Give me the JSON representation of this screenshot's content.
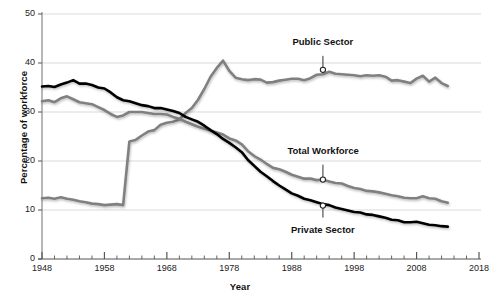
{
  "chart_data": {
    "type": "line",
    "title": "",
    "xlabel": "Year",
    "ylabel": "Percentage of workforce",
    "xlim": [
      1948,
      2018
    ],
    "ylim": [
      0,
      50
    ],
    "grid": true,
    "legend_position": "inline-annotations",
    "xticks": [
      1948,
      1958,
      1968,
      1978,
      1988,
      1998,
      2008,
      2018
    ],
    "yticks": [
      0,
      10,
      20,
      30,
      40,
      50
    ],
    "xtick_labels": [
      "1948",
      "1958",
      "1968",
      "1978",
      "1988",
      "1998",
      "2008",
      "2018"
    ],
    "ytick_labels": [
      "0",
      "10",
      "20",
      "30",
      "40",
      "50"
    ],
    "minor_tick_interval": 2,
    "colors": {
      "public_sector": "#808080",
      "total_workforce": "#808080",
      "private_sector": "#000000",
      "gridline": "#d9d9d9",
      "axis": "#999999"
    },
    "annotations": [
      {
        "label": "Public Sector",
        "x": 1993,
        "y": 38.6,
        "label_offset_y": -21
      },
      {
        "label": "Total Workforce",
        "x": 1993,
        "y": 16.2,
        "label_offset_y": -22
      },
      {
        "label": "Private Sector",
        "x": 1993,
        "y": 10.9,
        "label_offset_y": 19
      }
    ],
    "series": [
      {
        "name": "Public Sector",
        "color": "#808080",
        "x": [
          1948,
          1949,
          1950,
          1951,
          1952,
          1953,
          1954,
          1955,
          1956,
          1957,
          1958,
          1959,
          1960,
          1961,
          1962,
          1963,
          1964,
          1965,
          1966,
          1967,
          1968,
          1969,
          1970,
          1971,
          1972,
          1973,
          1974,
          1975,
          1976,
          1977,
          1978,
          1979,
          1980,
          1981,
          1982,
          1983,
          1984,
          1985,
          1986,
          1987,
          1988,
          1989,
          1990,
          1991,
          1992,
          1993,
          1994,
          1995,
          1996,
          1997,
          1998,
          1999,
          2000,
          2001,
          2002,
          2003,
          2004,
          2005,
          2006,
          2007,
          2008,
          2009,
          2010,
          2011,
          2012,
          2013
        ],
        "values": [
          12.4,
          12.5,
          12.3,
          12.6,
          12.3,
          12.1,
          11.8,
          11.6,
          11.3,
          11.2,
          11.0,
          11.1,
          11.2,
          11.0,
          24.0,
          24.3,
          25.2,
          26.0,
          26.3,
          27.4,
          27.8,
          28.0,
          28.5,
          29.8,
          30.8,
          32.5,
          34.7,
          37.2,
          39.0,
          40.5,
          38.4,
          37.0,
          36.7,
          36.5,
          36.7,
          36.6,
          36.0,
          36.1,
          36.4,
          36.6,
          36.8,
          36.8,
          36.5,
          36.9,
          37.6,
          37.7,
          38.2,
          37.8,
          37.7,
          37.6,
          37.5,
          37.3,
          37.5,
          37.4,
          37.5,
          37.2,
          36.4,
          36.5,
          36.2,
          35.9,
          36.8,
          37.4,
          36.2,
          37.0,
          35.9,
          35.3
        ]
      },
      {
        "name": "Total Workforce",
        "color": "#808080",
        "x": [
          1948,
          1949,
          1950,
          1951,
          1952,
          1953,
          1954,
          1955,
          1956,
          1957,
          1958,
          1959,
          1960,
          1961,
          1962,
          1963,
          1964,
          1965,
          1966,
          1967,
          1968,
          1969,
          1970,
          1971,
          1972,
          1973,
          1974,
          1975,
          1976,
          1977,
          1978,
          1979,
          1980,
          1981,
          1982,
          1983,
          1984,
          1985,
          1986,
          1987,
          1988,
          1989,
          1990,
          1991,
          1992,
          1993,
          1994,
          1995,
          1996,
          1997,
          1998,
          1999,
          2000,
          2001,
          2002,
          2003,
          2004,
          2005,
          2006,
          2007,
          2008,
          2009,
          2010,
          2011,
          2012,
          2013
        ],
        "values": [
          32.2,
          32.4,
          32.0,
          32.8,
          33.2,
          32.6,
          32.0,
          31.8,
          31.6,
          31.0,
          30.4,
          29.6,
          29.0,
          29.3,
          30.0,
          30.0,
          30.0,
          29.8,
          29.6,
          29.6,
          29.5,
          29.0,
          28.6,
          28.0,
          27.5,
          27.0,
          26.6,
          26.2,
          25.8,
          25.4,
          24.6,
          24.2,
          23.4,
          22.0,
          21.0,
          20.3,
          19.4,
          18.6,
          18.3,
          17.8,
          17.2,
          16.8,
          16.4,
          16.4,
          16.1,
          16.2,
          15.8,
          15.5,
          15.4,
          14.9,
          14.5,
          14.3,
          13.9,
          13.8,
          13.6,
          13.3,
          13.0,
          12.8,
          12.5,
          12.4,
          12.4,
          12.8,
          12.4,
          12.3,
          11.8,
          11.5
        ]
      },
      {
        "name": "Private Sector",
        "color": "#000000",
        "x": [
          1948,
          1949,
          1950,
          1951,
          1952,
          1953,
          1954,
          1955,
          1956,
          1957,
          1958,
          1959,
          1960,
          1961,
          1962,
          1963,
          1964,
          1965,
          1966,
          1967,
          1968,
          1969,
          1970,
          1971,
          1972,
          1973,
          1974,
          1975,
          1976,
          1977,
          1978,
          1979,
          1980,
          1981,
          1982,
          1983,
          1984,
          1985,
          1986,
          1987,
          1988,
          1989,
          1990,
          1991,
          1992,
          1993,
          1994,
          1995,
          1996,
          1997,
          1998,
          1999,
          2000,
          2001,
          2002,
          2003,
          2004,
          2005,
          2006,
          2007,
          2008,
          2009,
          2010,
          2011,
          2012,
          2013
        ],
        "values": [
          35.2,
          35.3,
          35.1,
          35.6,
          36.0,
          36.5,
          35.8,
          35.8,
          35.5,
          35.0,
          34.8,
          34.0,
          33.0,
          32.4,
          32.2,
          31.8,
          31.4,
          31.2,
          30.8,
          30.8,
          30.5,
          30.2,
          29.8,
          29.0,
          28.5,
          28.0,
          27.2,
          26.3,
          25.5,
          24.5,
          23.7,
          22.8,
          21.8,
          20.2,
          19.0,
          17.8,
          16.9,
          15.9,
          15.0,
          14.2,
          13.4,
          12.9,
          12.3,
          12.0,
          11.6,
          11.2,
          11.0,
          10.5,
          10.2,
          9.9,
          9.6,
          9.5,
          9.1,
          9.0,
          8.7,
          8.4,
          8.0,
          7.9,
          7.5,
          7.5,
          7.6,
          7.3,
          7.0,
          6.9,
          6.7,
          6.6
        ]
      }
    ]
  },
  "axes": {
    "y_title": "Percentage of workforce",
    "x_title": "Year"
  }
}
